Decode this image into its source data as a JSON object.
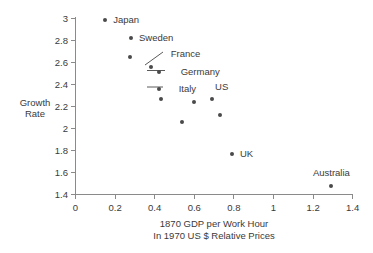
{
  "chart_data": {
    "type": "scatter",
    "title": "",
    "xlabel": "1870 GDP per Work Hour",
    "xlabel_line2": "In 1970 US $ Relative Prices",
    "ylabel": "Growth",
    "ylabel_line2": "Rate",
    "xlim": [
      0,
      1.4
    ],
    "ylim": [
      1.4,
      3.0
    ],
    "grid": false,
    "legend": "none",
    "marker_color": "#4a4a4a",
    "axis_color": "#7a7a7a",
    "xticks": [
      "0",
      "0.2",
      "0.4",
      "0.6",
      "0.8",
      "1",
      "1.2",
      "1.4"
    ],
    "xtick_values": [
      0,
      0.2,
      0.4,
      0.6,
      0.8,
      1.0,
      1.2,
      1.4
    ],
    "yticks": [
      "1.4",
      "1.6",
      "1.8",
      "2",
      "2.2",
      "2.4",
      "2.6",
      "2.8",
      "3"
    ],
    "ytick_values": [
      1.4,
      1.6,
      1.8,
      2.0,
      2.2,
      2.4,
      2.6,
      2.8,
      3.0
    ],
    "points": [
      {
        "label": "Japan",
        "x": 0.15,
        "y": 2.99
      },
      {
        "label": "Sweden",
        "x": 0.28,
        "y": 2.82
      },
      {
        "label": "",
        "x": 0.275,
        "y": 2.65
      },
      {
        "label": "France",
        "x": 0.38,
        "y": 2.56
      },
      {
        "label": "Germany",
        "x": 0.42,
        "y": 2.51
      },
      {
        "label": "Italy",
        "x": 0.42,
        "y": 2.36
      },
      {
        "label": "",
        "x": 0.43,
        "y": 2.27
      },
      {
        "label": "",
        "x": 0.54,
        "y": 2.06
      },
      {
        "label": "",
        "x": 0.6,
        "y": 2.24
      },
      {
        "label": "US",
        "x": 0.69,
        "y": 2.27
      },
      {
        "label": "",
        "x": 0.73,
        "y": 2.12
      },
      {
        "label": "UK",
        "x": 0.79,
        "y": 1.77
      },
      {
        "label": "Australia",
        "x": 1.29,
        "y": 1.48
      }
    ],
    "annotations": [
      {
        "text": "Japan",
        "style": "right-of-point"
      },
      {
        "text": "Sweden",
        "style": "right-of-point"
      },
      {
        "text": "France",
        "style": "diagonal-leader"
      },
      {
        "text": "Germany",
        "style": "horizontal-leader"
      },
      {
        "text": "Italy",
        "style": "horizontal-leader"
      },
      {
        "text": "US",
        "style": "above-point"
      },
      {
        "text": "UK",
        "style": "right-of-point"
      },
      {
        "text": "Australia",
        "style": "above-point"
      }
    ]
  }
}
